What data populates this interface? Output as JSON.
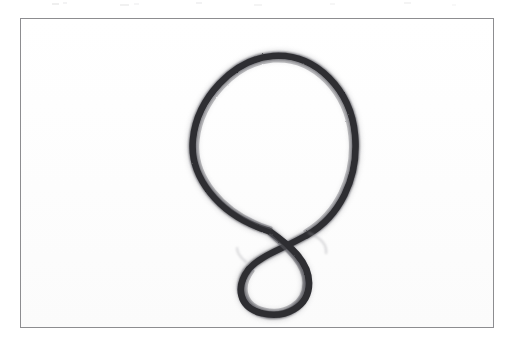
{
  "document": {
    "kind": "scanned-hand-drawing",
    "background_color": "#ffffff",
    "paper_color": "#ffffff",
    "alt_text": "Hand-drawn loop: a large rounded loop whose two ends cross near the bottom and continue into a small loop below."
  },
  "frame": {
    "name": "figure-border",
    "border_color": "#8d8d90",
    "border_width": "1px",
    "x": 20,
    "y": 18,
    "width": 474,
    "height": 310
  },
  "drawing": {
    "title": "loop-with-crossing",
    "stroke_color": "#2f2f33",
    "stroke_highlight_color": "#6a6a70",
    "stroke_soft_color": "#9a9aa0",
    "stroke_width": 7,
    "medium": "graphite",
    "big_loop": {
      "name": "large-loop",
      "center_x": 260,
      "center_y": 143,
      "radius_x": 72,
      "radius_y": 88,
      "top_y": 55,
      "left_x": 188,
      "right_x": 332,
      "bottom_y": 230
    },
    "small_loop": {
      "name": "small-loop",
      "center_x": 258,
      "center_y": 260,
      "radius_x": 34,
      "radius_y": 31,
      "top_y": 229,
      "left_x": 224,
      "right_x": 292,
      "bottom_y": 291
    },
    "crossing_point": {
      "name": "crossing",
      "x": 268,
      "y": 222
    }
  },
  "speckles": [
    {
      "x": 52,
      "y": 3,
      "w": 7,
      "h": 2,
      "o": 0.3
    },
    {
      "x": 63,
      "y": 2,
      "w": 4,
      "h": 2,
      "o": 0.22
    },
    {
      "x": 120,
      "y": 4,
      "w": 9,
      "h": 2,
      "o": 0.26
    },
    {
      "x": 134,
      "y": 3,
      "w": 5,
      "h": 2,
      "o": 0.18
    },
    {
      "x": 196,
      "y": 2,
      "w": 6,
      "h": 2,
      "o": 0.24
    },
    {
      "x": 254,
      "y": 4,
      "w": 8,
      "h": 2,
      "o": 0.2
    },
    {
      "x": 330,
      "y": 3,
      "w": 5,
      "h": 2,
      "o": 0.16
    },
    {
      "x": 404,
      "y": 2,
      "w": 7,
      "h": 2,
      "o": 0.2
    },
    {
      "x": 452,
      "y": 4,
      "w": 4,
      "h": 2,
      "o": 0.14
    }
  ]
}
